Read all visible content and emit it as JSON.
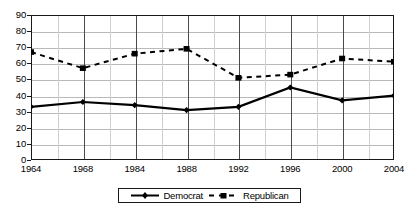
{
  "chart_data": {
    "type": "line",
    "title": "",
    "xlabel": "",
    "ylabel": "",
    "categories": [
      "1964",
      "1968",
      "1984",
      "1988",
      "1992",
      "1996",
      "2000",
      "2004"
    ],
    "series": [
      {
        "name": "Democrat",
        "marker": "diamond",
        "line_style": "solid",
        "color": "#000000",
        "values": [
          33,
          36,
          34,
          31,
          33,
          45,
          37,
          40
        ]
      },
      {
        "name": "Republican",
        "marker": "square",
        "line_style": "dashed",
        "color": "#000000",
        "values": [
          67,
          57,
          66,
          69,
          51,
          53,
          63,
          61
        ]
      }
    ],
    "ylim": [
      0,
      90
    ],
    "ytick_step": 10,
    "yticks": [
      "90",
      "80",
      "70",
      "60",
      "50",
      "40",
      "30",
      "20",
      "10",
      "0"
    ],
    "grid": true,
    "minor_vertical_gridlines": true,
    "legend_position": "bottom"
  },
  "legend": {
    "democrat_label": "Democrat",
    "republican_label": "Republican"
  }
}
